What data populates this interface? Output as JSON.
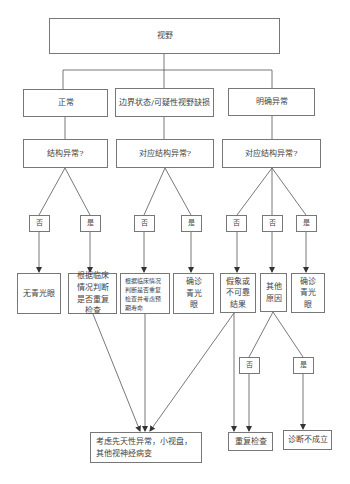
{
  "diagram": {
    "root": {
      "label": "视野"
    },
    "categories": [
      {
        "label": "正常",
        "question": "结构异常?"
      },
      {
        "label": "边界状态/可疑性视野缺损",
        "question": "对应结构异常?"
      },
      {
        "label": "明确异常",
        "question": "对应结构异常?"
      }
    ],
    "answers": [
      "否",
      "是",
      "否",
      "是",
      "否",
      "否",
      "是"
    ],
    "outcomes": [
      "无青光眼",
      "根据临床情况判断是否重复检查",
      "根据临床情况判断是否重复检查并考虑预期寿命",
      "确诊青光眼",
      "假象或不可靠结果",
      "其他原因",
      "确诊青光眼"
    ],
    "sub_answers": [
      "否",
      "是"
    ],
    "final": [
      "考虑先天性异常，小视盘，其他视神经病变",
      "重复检查",
      "诊断不成立"
    ]
  }
}
